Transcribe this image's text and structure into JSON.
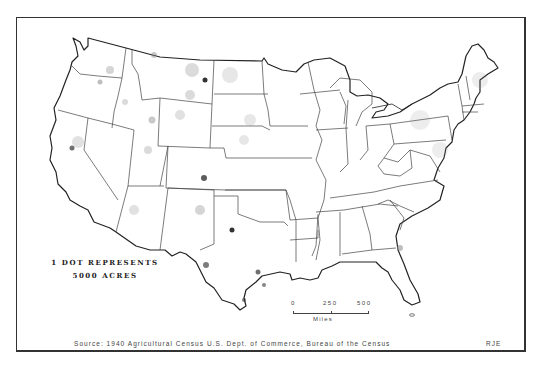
{
  "map": {
    "subject": "Conterminous United States dot-density map",
    "legend": {
      "line1": "1 DOT REPRESENTS",
      "line2": "5000 ACRES"
    },
    "scale_bar": {
      "ticks": [
        "0",
        "250",
        "500"
      ],
      "units": "Miles"
    },
    "source": "Source: 1940 Agricultural Census U.S. Dept. of Commerce, Bureau of the Census",
    "initials": "RJE",
    "colors": {
      "outline": "#222222",
      "state_lines": "#444444",
      "dots": "#888888",
      "dense_dots": "#333333",
      "background": "#ffffff"
    }
  }
}
